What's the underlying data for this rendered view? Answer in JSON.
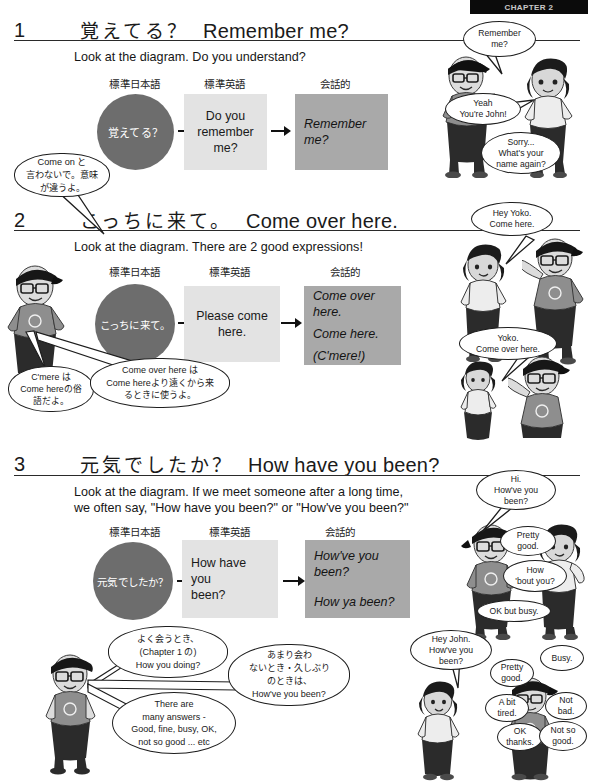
{
  "header": {
    "tab_label": "CHAPTER 2"
  },
  "sections": [
    {
      "number": "1",
      "title_jp": "覚えてる？",
      "title_en": "Remember me?",
      "instruction": "Look at the diagram. Do you understand?",
      "diagram": {
        "labels": [
          "標準日本語",
          "標準英語",
          "会話的"
        ],
        "circle_text": "覚えてる？",
        "box1_lines": [
          "Do you",
          "remember",
          "me?"
        ],
        "box2_lines": [
          "Remember me?"
        ]
      },
      "notes": [
        {
          "name": "come-on-note",
          "text": "Come on と\n言わないで。意味\nが違うよ。"
        }
      ],
      "bubbles": [
        {
          "name": "bubble-remember-me",
          "text": "Remember\nme?"
        },
        {
          "name": "bubble-yeah-youre-john",
          "text": "Yeah\nYou're John!"
        },
        {
          "name": "bubble-sorry-name-again",
          "text": "Sorry...\nWhat's your\nname again?"
        }
      ]
    },
    {
      "number": "2",
      "title_jp": "こっちに来て。",
      "title_en": "Come over here.",
      "instruction": "Look at the diagram. There are 2 good expressions!",
      "diagram": {
        "labels": [
          "標準日本語",
          "標準英語",
          "会話的"
        ],
        "circle_text": "こっちに来て。",
        "box1_lines": [
          "Please come here."
        ],
        "box2_lines": [
          "Come over here.",
          "Come here.",
          "(C'mere!)"
        ]
      },
      "notes": [
        {
          "name": "cmere-note",
          "text": "C'mere は\nCome hereの俗\n語だよ。"
        },
        {
          "name": "come-over-here-note",
          "text": "Come over here は\nCome hereより遠くから来\nるときに使うよ。"
        }
      ],
      "bubbles": [
        {
          "name": "bubble-hey-yoko-come-here",
          "text": "Hey Yoko.\nCome here."
        },
        {
          "name": "bubble-yoko-come-over-here",
          "text": "Yoko.\nCome over here."
        }
      ]
    },
    {
      "number": "3",
      "title_jp": "元気でしたか？",
      "title_en": "How have you been?",
      "instruction": "Look at the diagram. If we meet someone after a long time,\nwe often say, \"How have you been?\" or \"How've you been?\"",
      "diagram": {
        "labels": [
          "標準日本語",
          "標準英語",
          "会話的"
        ],
        "circle_text": "元気でしたか？",
        "box1_lines": [
          "How have you",
          "been?"
        ],
        "box2_lines": [
          "How've you been?",
          "How ya been?"
        ]
      },
      "notes": [
        {
          "name": "often-meet-note",
          "text": "よく会うとき、\n(Chapter 1 の)\nHow you doing?"
        },
        {
          "name": "rarely-meet-note",
          "text": "あまり会わ\nないとき・久しぶり\nのときは、\nHow've you been?"
        },
        {
          "name": "many-answers-note",
          "text": "There are\nmany answers -\nGood, fine, busy, OK,\nnot so good ... etc"
        }
      ],
      "bubbles": [
        {
          "name": "bubble-hi-howve-you-been",
          "text": "Hi.\nHow've you\nbeen?"
        },
        {
          "name": "bubble-pretty-good",
          "text": "Pretty\ngood."
        },
        {
          "name": "bubble-how-bout-you",
          "text": "How\n'bout you?"
        },
        {
          "name": "bubble-ok-but-busy",
          "text": "OK but busy."
        },
        {
          "name": "bubble-hey-john-howve-you-been",
          "text": "Hey John.\nHow've you\nbeen?"
        },
        {
          "name": "bubble-busy",
          "text": "Busy."
        },
        {
          "name": "bubble-pretty-good-2",
          "text": "Pretty\ngood."
        },
        {
          "name": "bubble-a-bit-tired",
          "text": "A bit\ntired."
        },
        {
          "name": "bubble-not-bad",
          "text": "Not\nbad."
        },
        {
          "name": "bubble-ok-thanks",
          "text": "OK\nthanks."
        },
        {
          "name": "bubble-not-so-good",
          "text": "Not so\ngood."
        }
      ]
    }
  ],
  "colors": {
    "circle_fill": "#6d6d6d",
    "box_light": "#e3e3e3",
    "box_mid": "#a9a9a9",
    "rule": "#2a2a2a",
    "ink": "#111111"
  }
}
